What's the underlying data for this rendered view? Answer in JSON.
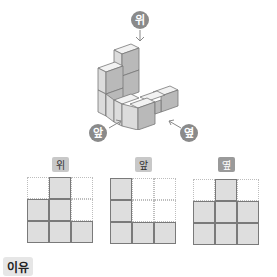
{
  "directions": {
    "top": "위",
    "front": "앞",
    "side": "옆"
  },
  "views": [
    {
      "label": "위",
      "cells": [
        [
          0,
          1,
          0
        ],
        [
          1,
          1,
          0
        ],
        [
          1,
          1,
          1
        ]
      ]
    },
    {
      "label": "앞",
      "cells": [
        [
          1,
          0,
          0
        ],
        [
          1,
          0,
          0
        ],
        [
          1,
          1,
          1
        ]
      ]
    },
    {
      "label": "옆",
      "cells": [
        [
          0,
          1,
          0
        ],
        [
          1,
          1,
          1
        ],
        [
          1,
          1,
          1
        ]
      ]
    }
  ],
  "reason_label": "이유",
  "colors": {
    "cube_top": "#f2f2f2",
    "cube_left": "#dcdcdc",
    "cube_right": "#b9b9b9",
    "cell_fill": "#dedede",
    "label_bg": "#c8c8c8"
  }
}
